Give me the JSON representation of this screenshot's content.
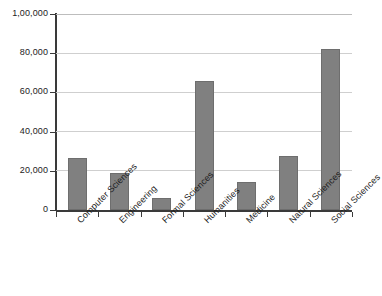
{
  "chart_data": {
    "type": "bar",
    "title": "",
    "subtitle": "",
    "xlabel": "",
    "ylabel": "",
    "categories": [
      "Computer Sciences",
      "Engineering",
      "Formal Sciences",
      "Humanities",
      "Medicine",
      "Natural Sciences",
      "Social Sciences"
    ],
    "values": [
      26500,
      19000,
      6000,
      66000,
      14500,
      27500,
      82000
    ],
    "ylim": [
      0,
      100000
    ],
    "ytick_values": [
      0,
      20000,
      40000,
      60000,
      80000,
      100000
    ],
    "ytick_labels": [
      "0",
      "20,000",
      "40,000",
      "60,000",
      "80,000",
      "1,00,000"
    ],
    "grid": true,
    "legend": false,
    "legend_position": "none",
    "bar_color": "#808080",
    "bar_border_color": "#6e6e6e",
    "gridline_color": "#cfcfcf",
    "axis_color": "#3a3a3a",
    "background_color": "#ffffff",
    "xlabel_rotation": -45
  }
}
